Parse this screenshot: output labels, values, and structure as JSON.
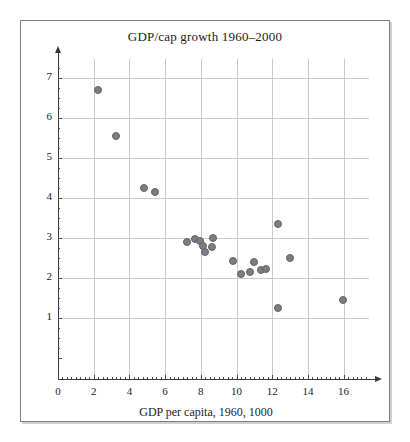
{
  "figure": {
    "title": "GDP/cap growth 1960–2000",
    "background_color": "#ffffff",
    "frame_color": "#7d7d7d"
  },
  "chart_data": {
    "type": "scatter",
    "title": "GDP/cap growth 1960–2000",
    "xlabel": "GDP per capita, 1960, 1000",
    "ylabel": "",
    "xlim": [
      0,
      18
    ],
    "ylim": [
      0,
      7.6
    ],
    "xticks": [
      0,
      2,
      4,
      6,
      8,
      10,
      12,
      14,
      16
    ],
    "yticks": [
      1,
      2,
      3,
      4,
      5,
      6,
      7
    ],
    "xticklabels": [
      "0",
      "2",
      "4",
      "6",
      "8",
      "10",
      "12",
      "14",
      "16"
    ],
    "yticklabels": [
      "1",
      "2",
      "3",
      "4",
      "5",
      "6",
      "7"
    ],
    "grid": true,
    "grid_color": "#c9c9cf",
    "minor_ticks": true,
    "legend": null,
    "marker_color": "#7c7c84",
    "marker_edge_color": "#63636b",
    "marker_size": 8,
    "points": [
      {
        "x": 2.25,
        "y": 6.7
      },
      {
        "x": 3.25,
        "y": 5.55
      },
      {
        "x": 4.8,
        "y": 4.25
      },
      {
        "x": 5.45,
        "y": 4.15
      },
      {
        "x": 7.25,
        "y": 2.9
      },
      {
        "x": 7.7,
        "y": 2.97
      },
      {
        "x": 7.95,
        "y": 2.93
      },
      {
        "x": 8.15,
        "y": 2.8
      },
      {
        "x": 8.25,
        "y": 2.65
      },
      {
        "x": 8.7,
        "y": 3.0
      },
      {
        "x": 8.6,
        "y": 2.78
      },
      {
        "x": 9.8,
        "y": 2.43
      },
      {
        "x": 10.25,
        "y": 2.1
      },
      {
        "x": 10.75,
        "y": 2.15
      },
      {
        "x": 11.0,
        "y": 2.4
      },
      {
        "x": 11.35,
        "y": 2.2
      },
      {
        "x": 11.65,
        "y": 2.22
      },
      {
        "x": 12.35,
        "y": 3.35
      },
      {
        "x": 12.35,
        "y": 1.25
      },
      {
        "x": 13.0,
        "y": 2.5
      },
      {
        "x": 15.95,
        "y": 1.45
      }
    ]
  },
  "axes": {
    "x_axis_name": "x-axis",
    "y_axis_name": "y-axis",
    "x_arrow": "arrow-right",
    "y_arrow": "arrow-up"
  }
}
